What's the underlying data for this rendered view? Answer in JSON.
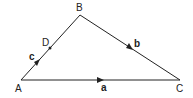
{
  "diagram": {
    "type": "triangle-vectors",
    "vertices": {
      "A": {
        "label": "A",
        "x": 21,
        "y": 80
      },
      "B": {
        "label": "B",
        "x": 80,
        "y": 15
      },
      "C": {
        "label": "C",
        "x": 180,
        "y": 80
      }
    },
    "points": {
      "D": {
        "label": "D",
        "x": 50,
        "y": 48
      }
    },
    "vectors": [
      {
        "name": "c",
        "label": "c",
        "from": "A",
        "to": "B"
      },
      {
        "name": "b",
        "label": "b",
        "from": "B",
        "to": "C"
      },
      {
        "name": "a",
        "label": "a",
        "from": "A",
        "to": "C"
      }
    ],
    "line_color": "#222222"
  }
}
